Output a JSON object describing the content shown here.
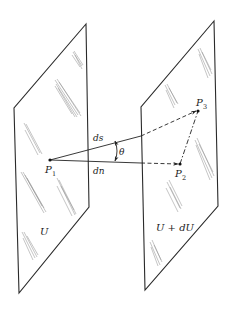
{
  "figure": {
    "surfaces": [
      {
        "id": "left",
        "label": "U"
      },
      {
        "id": "right",
        "label": "U + dU"
      }
    ],
    "points": [
      {
        "id": "P1",
        "label": "P",
        "subscript": "1"
      },
      {
        "id": "P2",
        "label": "P",
        "subscript": "2"
      },
      {
        "id": "P3",
        "label": "P",
        "subscript": "3"
      }
    ],
    "vectors": [
      {
        "from": "P1",
        "to": "P3",
        "label": "ds",
        "style": "solid-then-dashed"
      },
      {
        "from": "P1",
        "to": "P2",
        "label": "dn",
        "style": "solid-then-dashed"
      },
      {
        "from": "P2",
        "to": "P3",
        "label": "",
        "style": "dash-dot"
      }
    ],
    "angle": {
      "label": "θ",
      "between": [
        "ds",
        "dn"
      ]
    }
  },
  "labels": {
    "ds": "ds",
    "dn": "dn",
    "theta": "θ",
    "U": "U",
    "UdU": "U + dU",
    "P": "P",
    "sub1": "1",
    "sub2": "2",
    "sub3": "3"
  }
}
